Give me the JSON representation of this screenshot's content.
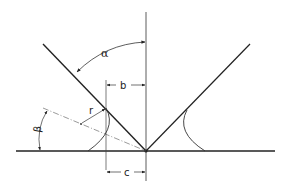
{
  "figure": {
    "type": "geometry-diagram",
    "labels": {
      "alpha": "α",
      "beta": "β",
      "radius": "r",
      "b": "b",
      "c": "c"
    },
    "colors": {
      "stroke": "#222222",
      "thin": "#444444",
      "background": "#ffffff"
    }
  }
}
